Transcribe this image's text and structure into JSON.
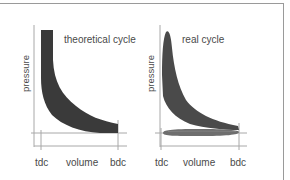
{
  "diagrams": [
    {
      "title": "theoretical cycle",
      "ylabel": "pressure",
      "xlabel": "volume",
      "x_ticks": [
        "tdc",
        "bdc"
      ]
    },
    {
      "title": "real cycle",
      "ylabel": "pressure",
      "xlabel": "volume",
      "x_ticks": [
        "tdc",
        "bdc"
      ]
    }
  ],
  "colors": {
    "fill_theoretical": "#3a3a3a",
    "fill_real": "#4a4a4a",
    "fill_pumping_loop": "#6e6e6e",
    "axis": "#a8a8a8",
    "frame": "#9a9a9a"
  }
}
